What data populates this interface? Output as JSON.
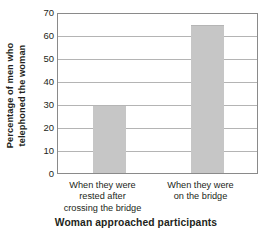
{
  "chart_data": {
    "type": "bar",
    "title": "",
    "xlabel": "Woman approached participants",
    "ylabel": "Percentage of men who telephoned the woman",
    "ylabel_lines": [
      "Percentage of men who",
      "telephoned the woman"
    ],
    "categories": [
      "When they were rested after crossing the bridge",
      "When they were on the bridge"
    ],
    "category_lines": [
      [
        "When they were",
        "rested after",
        "crossing the bridge"
      ],
      [
        "When they were",
        "on the bridge"
      ]
    ],
    "values": [
      30,
      65
    ],
    "ylim": [
      0,
      70
    ],
    "yticks": [
      0,
      10,
      20,
      30,
      40,
      50,
      60,
      70
    ],
    "ytick_labels": [
      "0",
      "10",
      "20",
      "30",
      "40",
      "50",
      "60",
      "70"
    ],
    "grid": "horizontal",
    "legend": "none",
    "colors": {
      "bar_fill": "#c6c6c6",
      "bar_edge": "#b5b5b5",
      "gridline": "#b4b4b4",
      "axis": "#8a8a8a",
      "text": "#231f20",
      "background": "#ffffff"
    }
  }
}
